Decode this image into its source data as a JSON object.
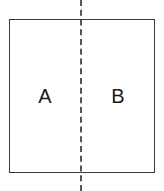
{
  "figure": {
    "canvas": {
      "width": 164,
      "height": 191,
      "background_color": "#ffffff"
    },
    "shape": {
      "name": "square",
      "stroke_color": "#3a3a3a",
      "fill_color": "#ffffff",
      "stroke_width": 1.4,
      "x": 9,
      "y": 19,
      "width": 146,
      "height": 154
    },
    "symmetry_line": {
      "orientation": "vertical",
      "style": "dashed",
      "color": "#555555",
      "stroke_width": 2,
      "x": 81,
      "y_start": 0,
      "y_end": 191
    },
    "regions": [
      {
        "id": "a",
        "label": "A",
        "position": "left",
        "center_x": 45,
        "center_y": 96,
        "text_color": "#1a1a1a"
      },
      {
        "id": "b",
        "label": "B",
        "position": "right",
        "center_x": 118,
        "center_y": 96,
        "text_color": "#1a1a1a"
      }
    ]
  }
}
